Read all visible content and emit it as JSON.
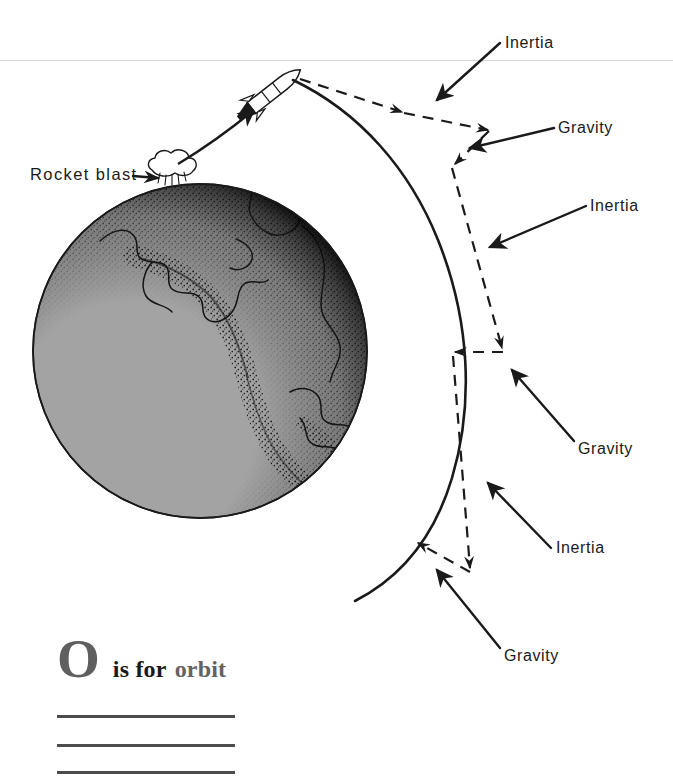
{
  "page": {
    "title": "O is for orbit",
    "width": 673,
    "height": 781,
    "background": "#ffffff"
  },
  "colors": {
    "ink": "#1a1a1a",
    "globe_fill": "#a3a3a3",
    "globe_outline": "#1a1a1a",
    "caption_gray": "#5f5f5f",
    "rule_gray": "#4c4c4c",
    "top_rule_gray": "#d8d8d8"
  },
  "diagram": {
    "name": "orbit-force-diagram",
    "earth": {
      "label": "earth-globe",
      "center_x": 200,
      "center_y": 351,
      "radius": 167,
      "fill": "#a3a3a3",
      "features": "North America coastlines with stippled terminator shading on lower-left limb"
    },
    "rocket": {
      "label": "rocket",
      "x": 270,
      "y": 90,
      "heading_degrees": -38
    },
    "blast": {
      "label": "rocket-blast-puff",
      "x": 165,
      "y": 168
    },
    "trajectory": {
      "label": "launch-trajectory",
      "style": "solid-curve-with-arrowhead"
    },
    "orbit_path": {
      "label": "orbit-path",
      "style": "solid-curve"
    }
  },
  "labels": [
    {
      "id": "rocket-blast",
      "text": "Rocket blast",
      "x": 30,
      "y": 166,
      "leader": "arrow-right"
    },
    {
      "id": "inertia-1",
      "text": "Inertia",
      "x": 505,
      "y": 35,
      "leader": "arrow-down-left"
    },
    {
      "id": "gravity-1",
      "text": "Gravity",
      "x": 558,
      "y": 120,
      "leader": "arrow-left"
    },
    {
      "id": "inertia-2",
      "text": "Inertia",
      "x": 590,
      "y": 198,
      "leader": "arrow-down-left"
    },
    {
      "id": "gravity-2",
      "text": "Gravity",
      "x": 578,
      "y": 441,
      "leader": "arrow-up-left"
    },
    {
      "id": "inertia-3",
      "text": "Inertia",
      "x": 556,
      "y": 540,
      "leader": "arrow-up-left"
    },
    {
      "id": "gravity-3",
      "text": "Gravity",
      "x": 504,
      "y": 648,
      "leader": "arrow-up-left"
    }
  ],
  "caption": {
    "letter": "O",
    "is_for": "is for",
    "word": "orbit"
  },
  "writing_rules": {
    "count": 3,
    "tops": [
      715,
      744,
      771
    ]
  }
}
